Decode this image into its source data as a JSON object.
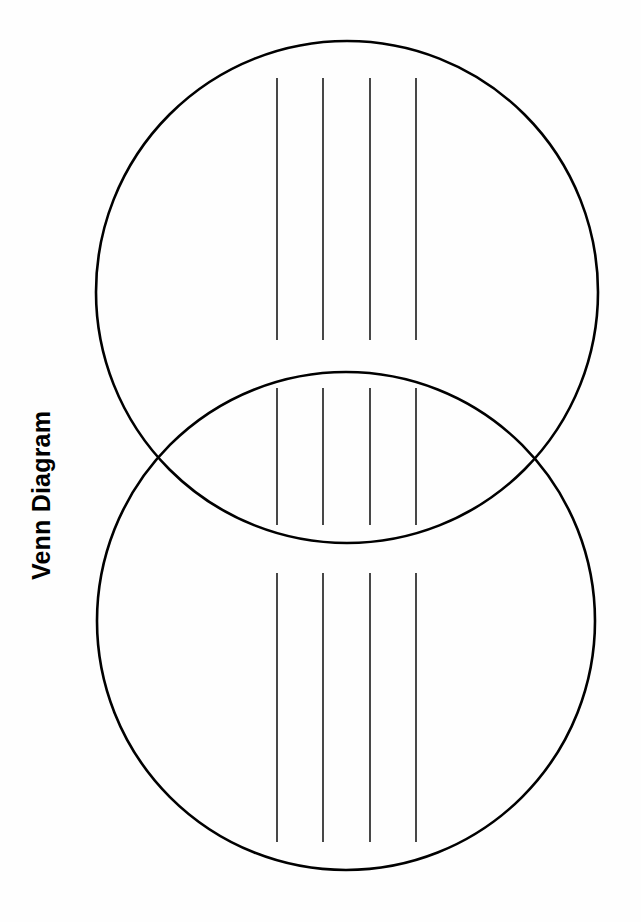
{
  "page": {
    "title": "Venn Diagram",
    "background_color": "#fefefe",
    "width": 641,
    "height": 922
  },
  "diagram": {
    "type": "venn",
    "set_count": 2,
    "stroke_color": "#000000",
    "line_color": "#1a1a1a",
    "circles": [
      {
        "name": "top-circle",
        "cx": 347,
        "cy": 292,
        "r": 251
      },
      {
        "name": "bottom-circle",
        "cx": 346,
        "cy": 621,
        "r": 249
      }
    ],
    "writing_line_x_positions": [
      277,
      323,
      370,
      416
    ],
    "writing_line_groups": [
      {
        "name": "top-region-lines",
        "y_start": 78,
        "y_end": 340
      },
      {
        "name": "overlap-region-lines",
        "y_start": 388,
        "y_end": 525
      },
      {
        "name": "bottom-region-lines",
        "y_start": 573,
        "y_end": 842
      }
    ]
  }
}
